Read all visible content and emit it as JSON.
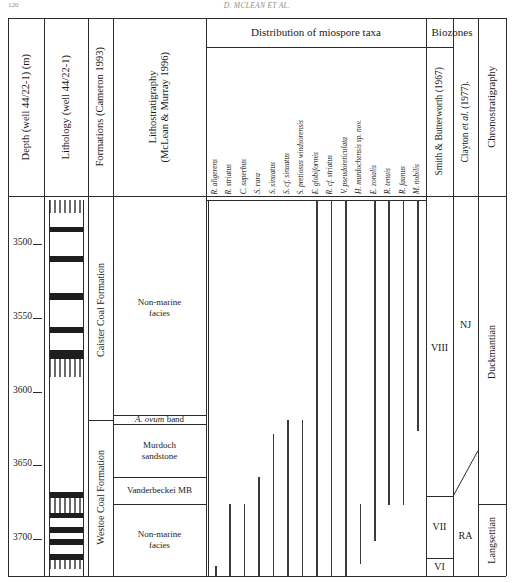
{
  "page": {
    "number": "120",
    "running_head": "D. MCLEAN ET AL."
  },
  "headers": {
    "depth": "Depth (well 44/22-1) (m)",
    "lithology": "Lithology (well 44/22-1)",
    "formations": "Formations (Cameron 1993)",
    "lithostratigraphy_line1": "Lithostratigraphy",
    "lithostratigraphy_line2": "(McLean & Murray 1996)",
    "distribution": "Distribution of miospore taxa",
    "biozones": "Biozones",
    "smith_butterworth": "Smith & Butterworth (1967)",
    "clayton": "Clayton et al. (1977).",
    "chronostratigraphy": "Chronostratigraphy"
  },
  "depth_axis": {
    "unit": "m",
    "ticks": [
      "3500",
      "3550",
      "3600",
      "3650",
      "3700"
    ],
    "top_depth": 3470,
    "bottom_depth": 3725
  },
  "formations": [
    {
      "name": "Caister Coal Formation",
      "top": 3470,
      "base": 3619
    },
    {
      "name": "Westoe Coal Formation",
      "top": 3619,
      "base": 3725
    }
  ],
  "lithostratigraphy_units": [
    {
      "label": "Non-marine facies",
      "top": 3470,
      "base": 3616
    },
    {
      "label": "A. ovum band",
      "top": 3616,
      "base": 3622,
      "italic_prefix": "A. ovum",
      "plain_suffix": " band"
    },
    {
      "label": "Murdoch sandstone",
      "top": 3622,
      "base": 3658
    },
    {
      "label": "Vanderbeckei MB",
      "top": 3658,
      "base": 3676
    },
    {
      "label": "Non-marine facies",
      "top": 3676,
      "base": 3725
    }
  ],
  "chart_data": {
    "type": "range_chart",
    "title": "Distribution of miospore taxa",
    "ylabel": "Depth (well 44/22-1) (m)",
    "ylim": [
      3725,
      3470
    ],
    "grid": false,
    "taxa": [
      {
        "label": "R. aligerens",
        "top": 3718,
        "base": 3725
      },
      {
        "label": "R. striatus",
        "top": 3676,
        "base": 3725
      },
      {
        "label": "C. superbus",
        "top": 3676,
        "base": 3725
      },
      {
        "label": "S. rara",
        "top": 3658,
        "base": 3725
      },
      {
        "label": "S. sinuatus",
        "top": 3629,
        "base": 3725
      },
      {
        "label": "S. cf. sinuatus",
        "top": 3619,
        "base": 3725
      },
      {
        "label": "S. pretiosus windsorensis",
        "top": 3619,
        "base": 3725
      },
      {
        "label": "E. globiformis",
        "top": 3470,
        "base": 3725
      },
      {
        "label": "R. cf. striatus",
        "top": 3470,
        "base": 3725
      },
      {
        "label": "V. pseudoreticulata",
        "top": 3470,
        "base": 3725
      },
      {
        "label": "H. murdochensis sp. nov.",
        "top": 3676,
        "base": 3717
      },
      {
        "label": "E. zonalis",
        "top": 3470,
        "base": 3701
      },
      {
        "label": "R. tenuis",
        "top": 3470,
        "base": 3677
      },
      {
        "label": "R. faunus",
        "top": 3470,
        "base": 3677
      },
      {
        "label": "M. nobilis",
        "top": 3470,
        "base": 3627
      }
    ]
  },
  "biozones_smith_butterworth": [
    {
      "label": "VIII",
      "top": 3470,
      "base": 3671
    },
    {
      "label": "VII",
      "top": 3671,
      "base": 3713
    },
    {
      "label": "VI",
      "top": 3713,
      "base": 3725
    }
  ],
  "biozones_clayton": [
    {
      "label": "NJ",
      "top": 3470,
      "base": 3640
    },
    {
      "label": "RA",
      "top": 3671,
      "base": 3725
    }
  ],
  "chronostratigraphy": [
    {
      "label": "Duckmantian",
      "top": 3470,
      "base": 3676
    },
    {
      "label": "Langsettian",
      "top": 3676,
      "base": 3725
    }
  ],
  "colors": {
    "line": "#2b2b2b",
    "bar": "#3a3a3a",
    "coal": "#1d1d1d",
    "background": "#ffffff"
  }
}
